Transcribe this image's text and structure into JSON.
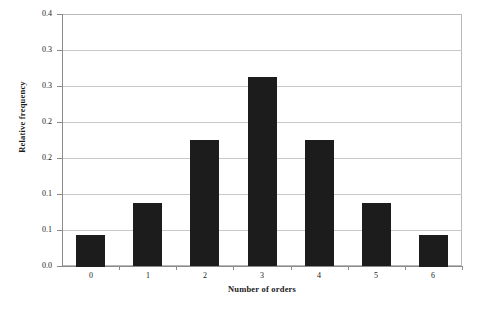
{
  "chart_data": {
    "type": "bar",
    "title": "",
    "xlabel": "Number of orders",
    "ylabel": "Relative frequency",
    "categories": [
      "0",
      "1",
      "2",
      "3",
      "4",
      "5",
      "6"
    ],
    "values": [
      0.05,
      0.1,
      0.2,
      0.3,
      0.2,
      0.1,
      0.05
    ],
    "series": [
      {
        "name": "Relative frequency",
        "values": [
          0.05,
          0.1,
          0.2,
          0.3,
          0.2,
          0.1,
          0.05
        ]
      }
    ],
    "ylim": [
      0.0,
      0.4
    ],
    "xlim": [
      null,
      null
    ],
    "y_tick_values": [
      0.4,
      0.35,
      0.3,
      0.25,
      0.2,
      0.15,
      0.1,
      0.0
    ],
    "y_tick_labels": [
      "0.4",
      "0.3",
      "0.3",
      "0.2",
      "0.2",
      "0.1",
      "0.1",
      "0.0"
    ],
    "x_tick_labels": [
      "0",
      "1",
      "2",
      "3",
      "4",
      "5",
      "6"
    ],
    "grid": "horizontal",
    "legend": "none",
    "bar_color": "#1c1c1c",
    "gridline_color": "#c8c8c8",
    "axis_color": "#8a8a8a",
    "background_color": "#ffffff"
  },
  "axes": {
    "y_title": "Relative frequency",
    "x_title": "Number of orders"
  }
}
